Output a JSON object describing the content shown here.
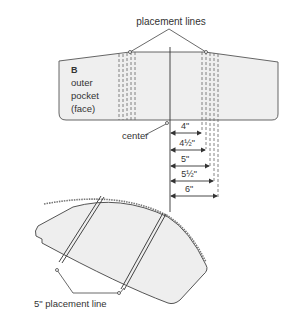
{
  "top_figure": {
    "callout_label": "placement lines",
    "piece_letter": "B",
    "piece_name_lines": [
      "outer",
      "pocket",
      "(face)"
    ],
    "center_label": "center",
    "measurements": [
      "4\"",
      "4½\"",
      "5\"",
      "5½\"",
      "6\""
    ]
  },
  "bottom_figure": {
    "callout_label": "5\" placement line"
  },
  "colors": {
    "fabric_fill": "#efefef",
    "outline": "#555555",
    "text": "#333333"
  }
}
